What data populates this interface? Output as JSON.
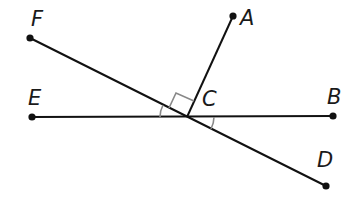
{
  "diagram": {
    "type": "geometry-lines",
    "points": [
      {
        "name": "F",
        "label": "F",
        "x": 30,
        "y": 38,
        "lx": 31,
        "ly": 26
      },
      {
        "name": "A",
        "label": "A",
        "x": 233,
        "y": 16,
        "lx": 240,
        "ly": 25
      },
      {
        "name": "E",
        "label": "E",
        "x": 32,
        "y": 117,
        "lx": 28,
        "ly": 105
      },
      {
        "name": "C",
        "label": "C",
        "x": 187,
        "y": 117,
        "lx": 202,
        "ly": 106
      },
      {
        "name": "B",
        "label": "B",
        "x": 333,
        "y": 116,
        "lx": 327,
        "ly": 104
      },
      {
        "name": "D",
        "label": "D",
        "x": 326,
        "y": 186,
        "lx": 317,
        "ly": 167
      }
    ],
    "segments": [
      {
        "name": "line-EB",
        "from": "E",
        "to": "B"
      },
      {
        "name": "line-FD",
        "from": "F",
        "to": "D"
      },
      {
        "name": "ray-CA",
        "from": "C",
        "to": "A"
      }
    ],
    "marks": {
      "right_angle": "angle FCA",
      "congruent_arcs": [
        "angle FCE",
        "angle BCD"
      ]
    },
    "colors": {
      "line": "#111111",
      "mark": "#888888"
    }
  }
}
